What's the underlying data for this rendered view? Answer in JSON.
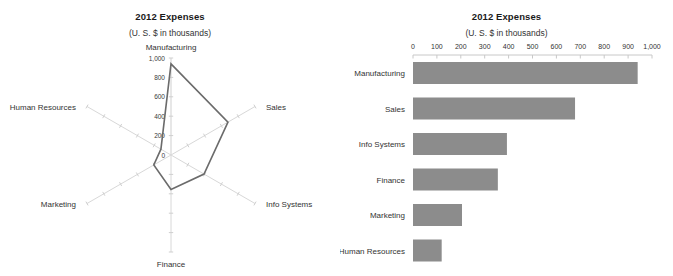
{
  "page": {
    "background_color": "#ffffff",
    "width": 673,
    "height": 276
  },
  "radar_panel": {
    "title": "2012 Expenses",
    "subtitle": "(U. S. $ in thousands)"
  },
  "bar_panel": {
    "title": "2012 Expenses",
    "subtitle": "(U. S. $ in thousands)"
  },
  "chart_data": [
    {
      "type": "radar",
      "title": "2012 Expenses",
      "subtitle": "(U. S. $ in thousands)",
      "xlabel": "",
      "ylabel": "",
      "categories": [
        "Manufacturing",
        "Sales",
        "Info Systems",
        "Finance",
        "Marketing",
        "Human Resources"
      ],
      "values": [
        940,
        678,
        393,
        355,
        205,
        120
      ],
      "radial_ticks": [
        "0",
        "200",
        "400",
        "600",
        "800",
        "1,000"
      ],
      "radial_tick_values": [
        0,
        200,
        400,
        600,
        800,
        1000
      ],
      "rlim": [
        0,
        1000
      ],
      "grid": false,
      "legend": "none",
      "series_color": "#6b6b6b",
      "spoke_color": "#d8d8d8",
      "start_angle_deg": 90,
      "direction": "clockwise"
    },
    {
      "type": "bar",
      "orientation": "horizontal",
      "title": "2012 Expenses",
      "subtitle": "(U. S. $ in thousands)",
      "xlabel": "",
      "ylabel": "",
      "categories": [
        "Manufacturing",
        "Sales",
        "Info Systems",
        "Finance",
        "Marketing",
        "Human Resources"
      ],
      "values": [
        940,
        678,
        393,
        355,
        205,
        120
      ],
      "tick_labels": [
        "0",
        "100",
        "200",
        "300",
        "400",
        "500",
        "600",
        "700",
        "800",
        "900",
        "1,000"
      ],
      "tick_values": [
        0,
        100,
        200,
        300,
        400,
        500,
        600,
        700,
        800,
        900,
        1000
      ],
      "xlim": [
        0,
        1000
      ],
      "grid": false,
      "legend": "none",
      "bar_color": "#8c8c8c",
      "axis_color": "#c8c8c8"
    }
  ]
}
